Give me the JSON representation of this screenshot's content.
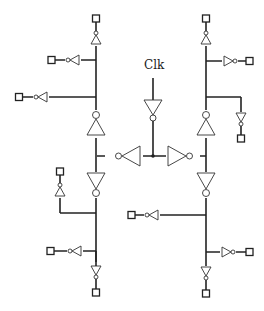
{
  "diagram": {
    "clock_label": "Clk",
    "colors": {
      "wire": "#222222",
      "gate_outline": "#333333",
      "background": "#ffffff"
    },
    "components": {
      "clock_input_inverter": 1,
      "center_inverters": 2,
      "trunk_inverters": 4,
      "leaf_buffers": 12,
      "output_pads": 12
    }
  }
}
